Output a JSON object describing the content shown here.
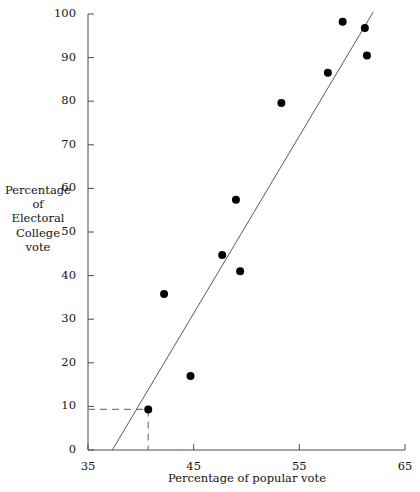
{
  "chart_data": {
    "type": "scatter",
    "title": "",
    "xlabel": "Percentage of popular vote",
    "ylabel": "Percentage of Electoral College vote",
    "ylabel_lines": [
      "Percentage",
      "of",
      "Electoral",
      "College",
      "vote"
    ],
    "xlim": [
      35,
      65
    ],
    "ylim": [
      0,
      100
    ],
    "xticks": [
      35,
      45,
      55,
      65
    ],
    "xtick_labels": [
      "35",
      "45",
      "55",
      "65"
    ],
    "yticks": [
      0,
      10,
      20,
      30,
      40,
      50,
      60,
      70,
      80,
      90,
      100
    ],
    "ytick_labels": [
      "0",
      "10",
      "20",
      "30",
      "40",
      "50",
      "60",
      "70",
      "80",
      "90",
      "100"
    ],
    "grid": false,
    "legend": false,
    "points": [
      {
        "x": 40.7,
        "y": 9.3
      },
      {
        "x": 42.2,
        "y": 35.8
      },
      {
        "x": 44.7,
        "y": 17.0
      },
      {
        "x": 47.7,
        "y": 44.7
      },
      {
        "x": 49.4,
        "y": 41.0
      },
      {
        "x": 49.0,
        "y": 57.4
      },
      {
        "x": 53.3,
        "y": 79.6
      },
      {
        "x": 57.7,
        "y": 86.5
      },
      {
        "x": 59.1,
        "y": 98.2
      },
      {
        "x": 61.2,
        "y": 96.8
      },
      {
        "x": 61.4,
        "y": 90.5
      }
    ],
    "fit_line": {
      "x_start": 37.3,
      "y_start": 0.0,
      "x_end": 62.0,
      "y_end": 100.5
    },
    "annotation_lines": [
      {
        "type": "dashed-horizontal",
        "y": 9.3,
        "x_from": 35.0,
        "x_to": 40.7
      },
      {
        "type": "dashed-vertical",
        "x": 40.7,
        "y_from": 9.3,
        "y_to": 0.0
      }
    ],
    "colors": {
      "point": "#000000",
      "axis": "#4a4a4a",
      "fit_line": "#5a5a5a",
      "dashed": "#7a7a7a",
      "background": "#ffffff"
    }
  }
}
